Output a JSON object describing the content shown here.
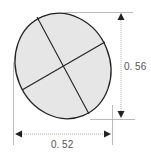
{
  "diagram": {
    "type": "dimensioned-ellipse",
    "shape": {
      "kind": "ellipse",
      "fill": "#e6e6e6",
      "stroke": "#222222",
      "center": [
        63,
        66
      ],
      "rx": 49,
      "ry": 54,
      "rotation_deg": -25,
      "axes": [
        {
          "from": [
            37,
            17
          ],
          "to": [
            89,
            114
          ]
        },
        {
          "from": [
            22,
            90
          ],
          "to": [
            105,
            42
          ]
        }
      ]
    },
    "dimensions": {
      "height": {
        "label": "0. 56",
        "value": 0.56,
        "orientation": "vertical"
      },
      "width": {
        "label": "0. 52",
        "value": 0.52,
        "orientation": "horizontal"
      }
    },
    "colors": {
      "line": "#222222",
      "dim_line": "#999999",
      "arrow": "#222222",
      "text": "#555555",
      "fill": "#e6e6e6"
    }
  }
}
